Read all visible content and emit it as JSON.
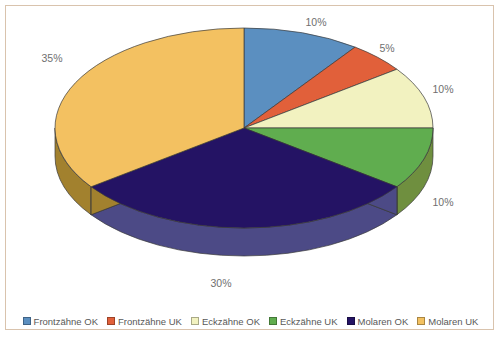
{
  "frame": {
    "border_color": "#d9c3ad",
    "background": "#ffffff"
  },
  "chart_data": {
    "type": "pie",
    "title": "",
    "subtitle": "",
    "xlabel": "",
    "ylabel": "",
    "three_d": true,
    "start_angle_deg": 0,
    "direction": "clockwise",
    "legend_position": "bottom",
    "grid": false,
    "value_unit": "%",
    "categories": [
      "Frontzähne OK",
      "Frontzähne UK",
      "Eckzähne OK",
      "Eckzähne UK",
      "Molaren OK",
      "Molaren UK"
    ],
    "values": [
      10,
      5,
      10,
      10,
      30,
      35
    ],
    "data_labels": [
      "10%",
      "5%",
      "10%",
      "10%",
      "30%",
      "35%"
    ],
    "colors": [
      "#5b8fc0",
      "#e1603a",
      "#f2f2c0",
      "#60ad4f",
      "#241364",
      "#f3c161"
    ],
    "side_colors": [
      "#46719c",
      "#b44a2c",
      "#c3c398",
      "#6f8f3f",
      "#4c4a86",
      "#a2812e"
    ],
    "label_color": "#6f6f6f",
    "slices": [
      {
        "label": "Frontzähne OK",
        "value": 10,
        "display": "10%",
        "color": "#5b8fc0",
        "side_color": "#46719c"
      },
      {
        "label": "Frontzähne UK",
        "value": 5,
        "display": "5%",
        "color": "#e1603a",
        "side_color": "#b44a2c"
      },
      {
        "label": "Eckzähne OK",
        "value": 10,
        "display": "10%",
        "color": "#f2f2c0",
        "side_color": "#c3c398"
      },
      {
        "label": "Eckzähne UK",
        "value": 10,
        "display": "10%",
        "color": "#60ad4f",
        "side_color": "#6f8f3f"
      },
      {
        "label": "Molaren OK",
        "value": 30,
        "display": "30%",
        "color": "#241364",
        "side_color": "#4c4a86"
      },
      {
        "label": "Molaren UK",
        "value": 35,
        "display": "35%",
        "color": "#f3c161",
        "side_color": "#a2812e"
      }
    ]
  },
  "labels": {
    "frontzaehne_ok": "10%",
    "frontzaehne_uk": "5%",
    "eckzaehne_ok": "10%",
    "eckzaehne_uk": "10%",
    "molaren_ok": "30%",
    "molaren_uk": "35%"
  },
  "legend": {
    "items": [
      {
        "label": "Frontzähne OK",
        "color": "#5b8fc0"
      },
      {
        "label": "Frontzähne UK",
        "color": "#e1603a"
      },
      {
        "label": "Eckzähne OK",
        "color": "#f2f2c0"
      },
      {
        "label": "Eckzähne UK",
        "color": "#60ad4f"
      },
      {
        "label": "Molaren OK",
        "color": "#241364"
      },
      {
        "label": "Molaren UK",
        "color": "#f3c161"
      }
    ]
  }
}
